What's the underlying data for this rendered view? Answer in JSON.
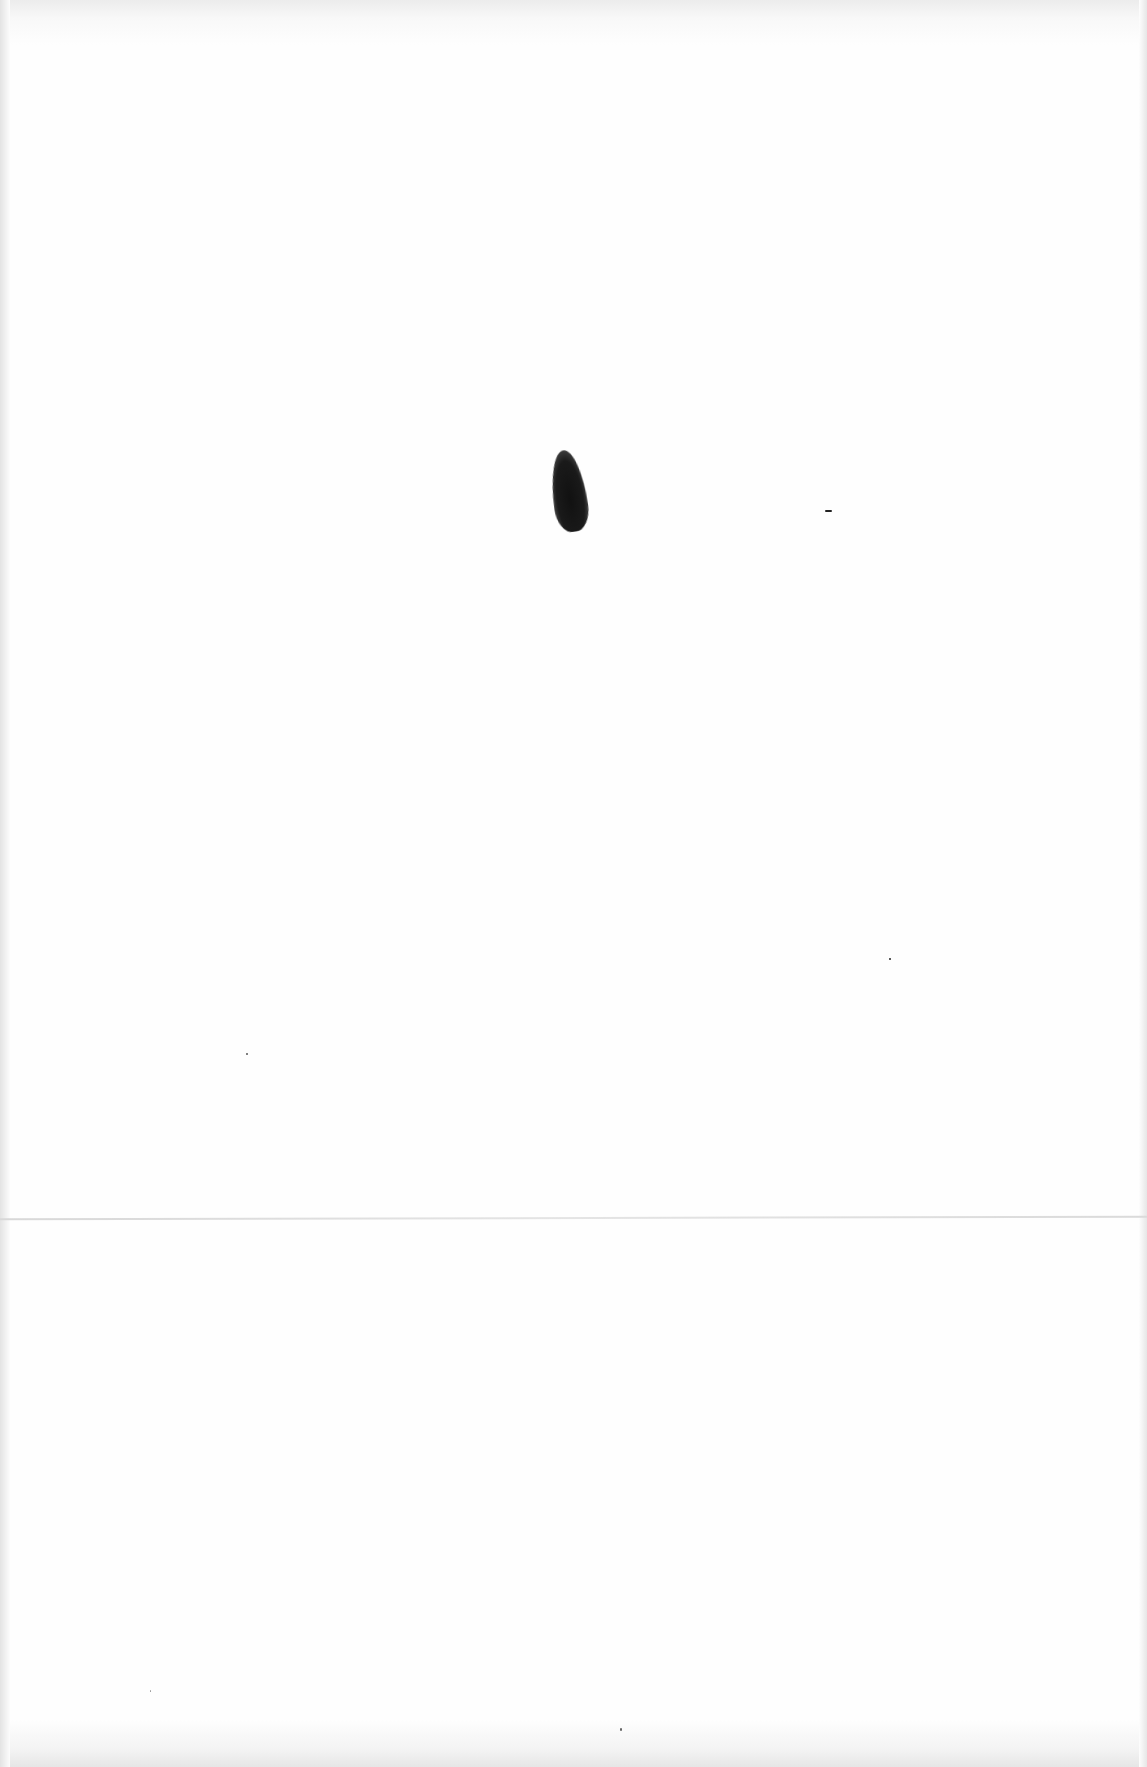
{
  "document": {
    "type": "blank scanned page",
    "text_content": "",
    "marks": [
      {
        "kind": "ink-blot",
        "description": "dark elongated smudge near upper center"
      },
      {
        "kind": "speck",
        "description": "small dash to the right of blot"
      },
      {
        "kind": "speck",
        "description": "small dots scattered lower on page"
      }
    ],
    "fold_line": true
  }
}
